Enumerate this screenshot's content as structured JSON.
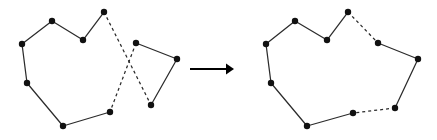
{
  "figure": {
    "width": 437,
    "height": 140,
    "background_color": "#ffffff",
    "stroke_color": "#2b2b2b",
    "vertex_color": "#111111",
    "arrow_color": "#000000",
    "vertex_radius": 3.2,
    "caption": ""
  },
  "arrow": {
    "name": "transformation-arrow",
    "label": "",
    "x1": 190,
    "y1": 69,
    "x2": 226,
    "y2": 69,
    "head_points": "226,63.5 234,69 226,74.5"
  },
  "left_shape": {
    "name": "self-intersecting-polygon",
    "label": "",
    "vertices": [
      {
        "id": "L0",
        "x": 22,
        "y": 44
      },
      {
        "id": "L1",
        "x": 52,
        "y": 21
      },
      {
        "id": "L2",
        "x": 83,
        "y": 40
      },
      {
        "id": "L3",
        "x": 104,
        "y": 12
      },
      {
        "id": "L4",
        "x": 151,
        "y": 105
      },
      {
        "id": "L5",
        "x": 177,
        "y": 59
      },
      {
        "id": "L6",
        "x": 136,
        "y": 43
      },
      {
        "id": "L7",
        "x": 110,
        "y": 112
      },
      {
        "id": "L8",
        "x": 63,
        "y": 126
      },
      {
        "id": "L9",
        "x": 27,
        "y": 83
      }
    ],
    "edges": [
      {
        "from": "L0",
        "to": "L1",
        "style": "solid"
      },
      {
        "from": "L1",
        "to": "L2",
        "style": "solid"
      },
      {
        "from": "L2",
        "to": "L3",
        "style": "solid"
      },
      {
        "from": "L3",
        "to": "L4",
        "style": "dashed"
      },
      {
        "from": "L4",
        "to": "L5",
        "style": "solid"
      },
      {
        "from": "L5",
        "to": "L6",
        "style": "solid"
      },
      {
        "from": "L6",
        "to": "L7",
        "style": "dashed"
      },
      {
        "from": "L7",
        "to": "L8",
        "style": "solid"
      },
      {
        "from": "L8",
        "to": "L9",
        "style": "solid"
      },
      {
        "from": "L9",
        "to": "L0",
        "style": "solid"
      }
    ]
  },
  "right_shape": {
    "name": "simple-polygon",
    "label": "",
    "vertices": [
      {
        "id": "R0",
        "x": 266,
        "y": 44
      },
      {
        "id": "R1",
        "x": 295,
        "y": 21
      },
      {
        "id": "R2",
        "x": 327,
        "y": 40
      },
      {
        "id": "R3",
        "x": 348,
        "y": 12
      },
      {
        "id": "R4",
        "x": 378,
        "y": 43
      },
      {
        "id": "R5",
        "x": 418,
        "y": 59
      },
      {
        "id": "R6",
        "x": 395,
        "y": 108
      },
      {
        "id": "R7",
        "x": 353,
        "y": 113
      },
      {
        "id": "R8",
        "x": 307,
        "y": 126
      },
      {
        "id": "R9",
        "x": 271,
        "y": 83
      }
    ],
    "edges": [
      {
        "from": "R0",
        "to": "R1",
        "style": "solid"
      },
      {
        "from": "R1",
        "to": "R2",
        "style": "solid"
      },
      {
        "from": "R2",
        "to": "R3",
        "style": "solid"
      },
      {
        "from": "R3",
        "to": "R4",
        "style": "dashed"
      },
      {
        "from": "R4",
        "to": "R5",
        "style": "solid"
      },
      {
        "from": "R5",
        "to": "R6",
        "style": "solid"
      },
      {
        "from": "R6",
        "to": "R7",
        "style": "dashed"
      },
      {
        "from": "R7",
        "to": "R8",
        "style": "solid"
      },
      {
        "from": "R8",
        "to": "R9",
        "style": "solid"
      },
      {
        "from": "R9",
        "to": "R0",
        "style": "solid"
      }
    ]
  }
}
